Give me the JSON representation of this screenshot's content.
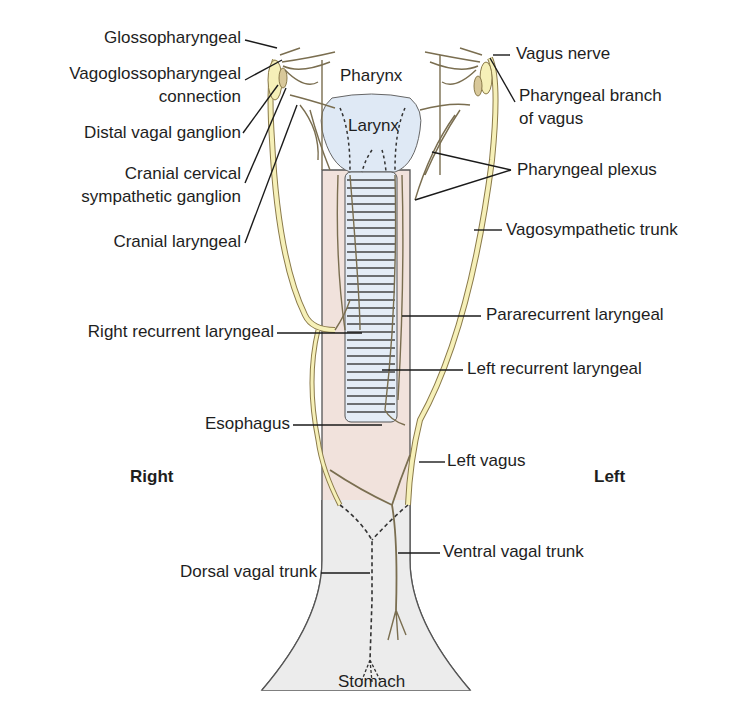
{
  "diagram": {
    "colors": {
      "nerve_fill": "#f6f0b8",
      "nerve_stroke": "#8a7a4a",
      "esophagus": "#f1e2dc",
      "stomach": "#eeeeee",
      "larynx": "#dfe9f5",
      "trachea_rings": "#e4ecf6",
      "leader_line": "#1a1a1a"
    },
    "structures": {
      "pharynx": "Pharynx",
      "larynx": "Larynx",
      "stomach": "Stomach"
    },
    "sides": {
      "right": "Right",
      "left": "Left"
    },
    "labels_left": [
      {
        "id": "glossopharyngeal",
        "text": "Glossopharyngeal"
      },
      {
        "id": "vagoglossopharyngeal-1",
        "text": "Vagoglossopharyngeal"
      },
      {
        "id": "vagoglossopharyngeal-2",
        "text": "connection"
      },
      {
        "id": "distal-vagal-ganglion",
        "text": "Distal vagal ganglion"
      },
      {
        "id": "cranial-cervical-1",
        "text": "Cranial cervical"
      },
      {
        "id": "cranial-cervical-2",
        "text": "sympathetic ganglion"
      },
      {
        "id": "cranial-laryngeal",
        "text": "Cranial laryngeal"
      },
      {
        "id": "right-recurrent-laryngeal",
        "text": "Right recurrent laryngeal"
      },
      {
        "id": "esophagus",
        "text": "Esophagus"
      },
      {
        "id": "dorsal-vagal-trunk",
        "text": "Dorsal vagal trunk"
      }
    ],
    "labels_right": [
      {
        "id": "vagus-nerve",
        "text": "Vagus nerve"
      },
      {
        "id": "pharyngeal-branch-1",
        "text": "Pharyngeal branch"
      },
      {
        "id": "pharyngeal-branch-2",
        "text": "of vagus"
      },
      {
        "id": "pharyngeal-plexus",
        "text": "Pharyngeal plexus"
      },
      {
        "id": "vagosympathetic-trunk",
        "text": "Vagosympathetic trunk"
      },
      {
        "id": "pararecurrent-laryngeal",
        "text": "Pararecurrent laryngeal"
      },
      {
        "id": "left-recurrent-laryngeal",
        "text": "Left recurrent laryngeal"
      },
      {
        "id": "left-vagus",
        "text": "Left vagus"
      },
      {
        "id": "ventral-vagal-trunk",
        "text": "Ventral vagal trunk"
      }
    ]
  }
}
